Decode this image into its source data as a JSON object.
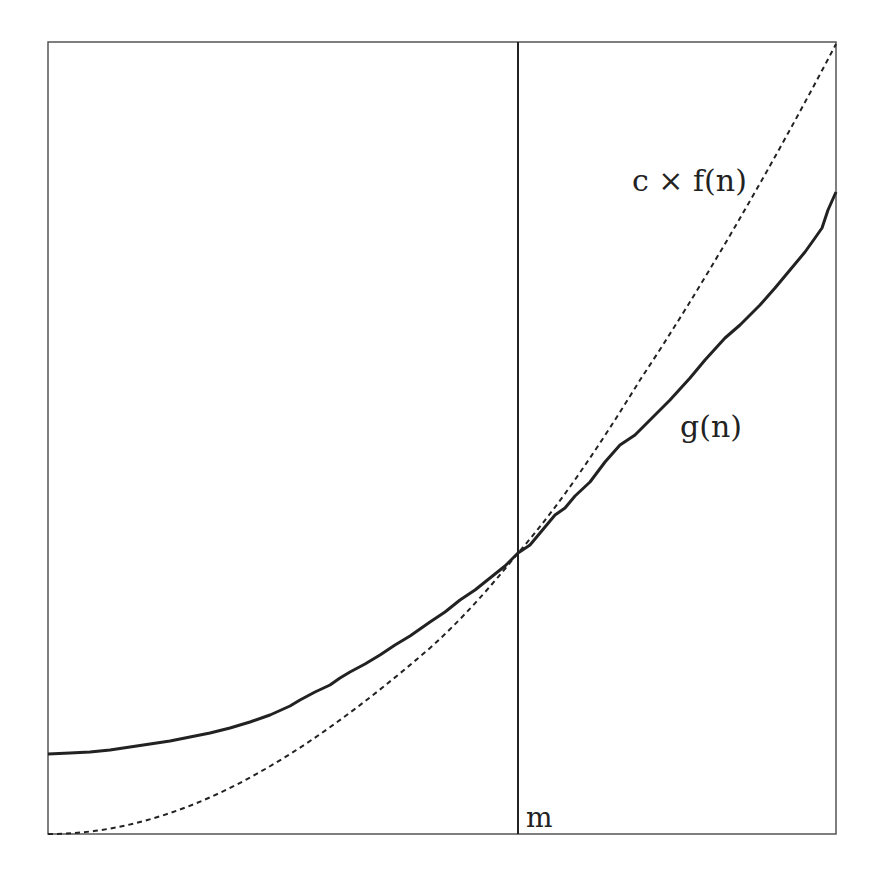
{
  "diagram": {
    "labels": {
      "cf": "c × f(n)",
      "g": "g(n)",
      "m": "m"
    },
    "colors": {
      "frame": "#555555",
      "curve": "#222222",
      "background": "#ffffff"
    },
    "curves": [
      {
        "name": "c × f(n)",
        "style": "dashed"
      },
      {
        "name": "g(n)",
        "style": "solid"
      }
    ],
    "marker": {
      "name": "m",
      "style": "vertical line at intersection"
    }
  }
}
